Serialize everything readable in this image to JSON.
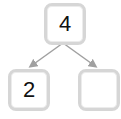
{
  "diagram": {
    "type": "number-bond",
    "root": {
      "value": "4"
    },
    "children": [
      {
        "value": "2"
      },
      {
        "value": ""
      }
    ],
    "colors": {
      "box_border": "#d6d6d6",
      "arrow": "#a0a0a0",
      "text": "#111111"
    }
  }
}
